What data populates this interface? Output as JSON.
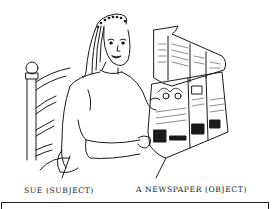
{
  "illustration": {
    "description": "Woman sitting in a ladder-back chair reading a newspaper",
    "labels": {
      "subject": "SUE (SUBJECT)",
      "object": "A NEWSPAPER (OBJECT)"
    },
    "colors": {
      "ink": "#1a1a1a",
      "paper": "#ffffff"
    }
  }
}
